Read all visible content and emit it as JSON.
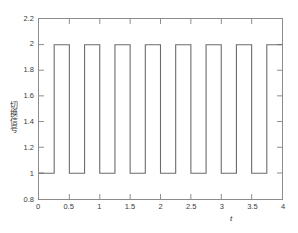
{
  "chart_data": {
    "type": "line",
    "title": "",
    "subtitle": "",
    "xlabel": "t",
    "ylabel": "切换信号",
    "xlim": [
      0,
      4
    ],
    "ylim": [
      0.8,
      2.2
    ],
    "xticks": [
      0,
      0.5,
      1,
      1.5,
      2,
      2.5,
      3,
      3.5,
      4
    ],
    "xticklabels": [
      "0",
      "0.5",
      "1",
      "1.5",
      "2",
      "2.5",
      "3",
      "3.5",
      "4"
    ],
    "yticks": [
      0.8,
      1.0,
      1.2,
      1.4,
      1.6,
      1.8,
      2.0,
      2.2
    ],
    "yticklabels": [
      "0.8",
      "1",
      "1.2",
      "1.4",
      "1.6",
      "1.8",
      "2",
      "2.2"
    ],
    "grid": false,
    "legend": null,
    "legend_position": "none",
    "line_color": "#6b6b6b",
    "axis_color": "#8c8c8c",
    "background_color": "#ffffff",
    "waveform": {
      "description": "square wave alternating between levels 1 and 2",
      "low_level": 1,
      "high_level": 2,
      "period": 0.5,
      "duty_cycle": 0.5,
      "first_rising_edge": 0.25,
      "pulse_count": 8
    },
    "series": [
      {
        "name": "switching signal",
        "x": [
          0,
          0.25,
          0.25,
          0.5,
          0.5,
          0.75,
          0.75,
          1.0,
          1.0,
          1.25,
          1.25,
          1.5,
          1.5,
          1.75,
          1.75,
          2.0,
          2.0,
          2.25,
          2.25,
          2.5,
          2.5,
          2.75,
          2.75,
          3.0,
          3.0,
          3.25,
          3.25,
          3.5,
          3.5,
          3.75,
          3.75,
          4.0
        ],
        "values": [
          1,
          1,
          2,
          2,
          1,
          1,
          2,
          2,
          1,
          1,
          2,
          2,
          1,
          1,
          2,
          2,
          1,
          1,
          2,
          2,
          1,
          1,
          2,
          2,
          1,
          1,
          2,
          2,
          1,
          1,
          2,
          2
        ]
      }
    ]
  }
}
